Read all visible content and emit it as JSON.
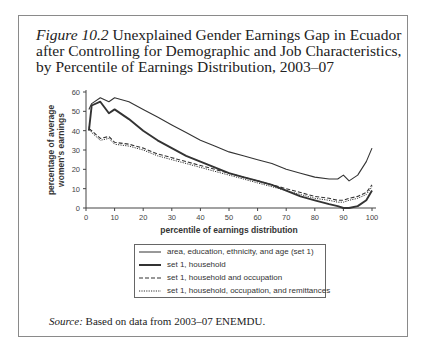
{
  "figure": {
    "label": "Figure 10.2",
    "title": "Unexplained Gender Earnings Gap in Ecuador after Controlling for Demographic and Job Characteristics, by Percentile of Earnings Distribution, 2003–07",
    "title_line1": "Unexplained Gender Earnings Gap in Ecuador",
    "title_line2": "after Controlling for Demographic and Job Characteristics,",
    "title_line3": "by Percentile of Earnings Distribution, 2003–07"
  },
  "source": {
    "label": "Source:",
    "text": "Based on data from 2003–07 ENEMDU."
  },
  "chart_data": {
    "type": "line",
    "title": "Unexplained Gender Earnings Gap in Ecuador after Controlling for Demographic and Job Characteristics, by Percentile of Earnings Distribution, 2003–07",
    "xlabel": "percentile of earnings distribution",
    "ylabel": "percentage of average women's earnings",
    "xlim": [
      0,
      100
    ],
    "ylim": [
      0,
      60
    ],
    "xticks": [
      0,
      10,
      20,
      30,
      40,
      50,
      60,
      70,
      80,
      90,
      100
    ],
    "yticks": [
      0,
      10,
      20,
      30,
      40,
      50,
      60
    ],
    "grid": false,
    "legend_position": "below",
    "x": [
      1,
      2,
      5,
      8,
      10,
      15,
      20,
      25,
      30,
      35,
      40,
      45,
      50,
      55,
      60,
      65,
      70,
      75,
      80,
      85,
      88,
      90,
      92,
      95,
      98,
      100
    ],
    "series": [
      {
        "name": "area, education, ethnicity, and age (set 1)",
        "style": "solid-thin",
        "values": [
          51,
          54,
          57,
          55,
          57,
          55,
          51,
          47,
          43,
          39,
          35,
          32,
          29,
          27,
          25,
          23,
          20,
          18,
          16,
          15,
          15,
          17,
          14,
          17,
          24,
          31
        ]
      },
      {
        "name": "set 1, household",
        "style": "solid-thick",
        "values": [
          40,
          53,
          55,
          49,
          51,
          46,
          40,
          35,
          31,
          27,
          24,
          21,
          18,
          16,
          14,
          12,
          9,
          6,
          4,
          2,
          1,
          0,
          0,
          1,
          4,
          9
        ]
      },
      {
        "name": "set 1, household and occupation",
        "style": "dashed",
        "values": [
          41,
          40,
          36,
          37,
          34,
          33,
          31,
          28,
          26,
          24,
          22,
          20,
          18,
          16,
          14,
          12,
          10,
          8,
          6,
          5,
          4,
          4,
          5,
          6,
          8,
          12
        ]
      },
      {
        "name": "set 1, household, occupation, and remittances",
        "style": "dotted",
        "values": [
          42,
          39,
          35,
          36,
          33,
          32,
          30,
          27,
          25,
          23,
          21,
          19,
          17,
          15,
          13,
          11,
          9,
          7,
          5,
          4,
          3,
          3,
          4,
          5,
          7,
          11
        ]
      }
    ]
  }
}
